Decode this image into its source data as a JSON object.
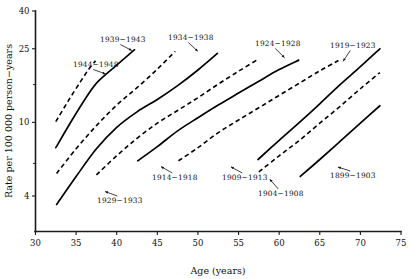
{
  "chart_data": {
    "type": "line",
    "title": "",
    "xlabel": "Age (years)",
    "ylabel": "Rate per 100 000 person−years",
    "xlim": [
      30,
      75
    ],
    "ylim": [
      3,
      40
    ],
    "yscale": "log",
    "grid": false,
    "legend": "inline-labels",
    "xticks": [
      30,
      35,
      40,
      45,
      50,
      55,
      60,
      65,
      70,
      75
    ],
    "xticklabels": [
      "30",
      "35",
      "40",
      "45",
      "50",
      "55",
      "60",
      "65",
      "70",
      "75"
    ],
    "yticks": [
      4,
      10,
      25,
      40
    ],
    "yticklabels": [
      "4",
      "10",
      "25",
      "40"
    ],
    "yticks_minor": [
      6,
      16
    ],
    "series": [
      {
        "name": "1944–1948",
        "style": "dashed",
        "label_text": "1944−1948",
        "x": [
          32.5,
          34.0,
          35.5,
          36.6,
          37.4
        ],
        "values": [
          10.1,
          13.0,
          16.5,
          19.5,
          21.5
        ]
      },
      {
        "name": "1939–1943",
        "style": "solid",
        "label_text": "1939−1943",
        "x": [
          32.5,
          34.5,
          36.5,
          37.8,
          40.0,
          42.2
        ],
        "values": [
          7.3,
          10.3,
          14.2,
          16.8,
          20.4,
          24.7
        ]
      },
      {
        "name": "1934–1938",
        "style": "dashed",
        "label_text": "1934−1938",
        "x": [
          32.6,
          35.0,
          37.5,
          40.0,
          42.5,
          45.0,
          47.2
        ],
        "values": [
          5.3,
          7.2,
          9.6,
          12.4,
          15.4,
          19.4,
          24.2
        ]
      },
      {
        "name": "1929–1933",
        "style": "solid",
        "label_text": "1929−1933",
        "x": [
          32.6,
          35.0,
          37.5,
          40.0,
          42.5,
          45.0,
          47.5,
          50.0,
          52.4
        ],
        "values": [
          3.6,
          5.1,
          7.2,
          9.4,
          11.4,
          13.3,
          15.8,
          19.2,
          23.6
        ]
      },
      {
        "name": "1924–1928",
        "style": "dashed",
        "label_text": "1924−1928",
        "x": [
          37.5,
          40.0,
          42.5,
          45.0,
          47.5,
          50.0,
          52.5,
          55.0,
          57.3
        ],
        "values": [
          5.2,
          6.6,
          8.2,
          9.9,
          11.6,
          13.6,
          16.1,
          18.9,
          21.8
        ]
      },
      {
        "name": "1914–1918",
        "style": "solid",
        "label_text": "1914−1918",
        "x": [
          42.6,
          45.0,
          47.5,
          50.0,
          52.5,
          55.0,
          57.5,
          60.0,
          62.4
        ],
        "values": [
          6.2,
          7.4,
          9.0,
          10.6,
          12.4,
          14.4,
          16.7,
          19.3,
          21.7
        ]
      },
      {
        "name": "1909–1913",
        "style": "dashed",
        "label_text": "1909−1913",
        "x": [
          47.6,
          50.0,
          52.5,
          55.0,
          57.5,
          60.0,
          62.5,
          65.0,
          67.3
        ],
        "values": [
          6.2,
          7.3,
          8.8,
          10.3,
          12.0,
          14.0,
          16.3,
          19.0,
          21.6
        ]
      },
      {
        "name": "1919–1923",
        "style": "solid",
        "label_text": "1919−1923",
        "x": [
          57.4,
          60.0,
          62.5,
          65.0,
          67.5,
          70.0,
          72.4
        ],
        "values": [
          6.3,
          8.0,
          10.0,
          12.6,
          16.0,
          20.0,
          25.0
        ]
      },
      {
        "name": "1904–1908",
        "style": "dashed",
        "label_text": "1904−1908",
        "x": [
          57.5,
          60.0,
          62.5,
          65.0,
          67.5,
          70.0,
          72.4
        ],
        "values": [
          5.4,
          6.6,
          8.0,
          9.9,
          12.2,
          15.2,
          18.6
        ]
      },
      {
        "name": "1899–1903",
        "style": "solid",
        "label_text": "1899−1903",
        "x": [
          62.6,
          65.0,
          67.5,
          70.0,
          72.4
        ],
        "values": [
          5.1,
          6.3,
          7.9,
          9.9,
          12.3
        ]
      }
    ],
    "annotations": [
      {
        "text": "1944−1948",
        "x": 73,
        "y": 67,
        "anchor": "start",
        "leader_to_x": 128,
        "leader_to_y": 82
      },
      {
        "text": "1939−1943",
        "x": 100,
        "y": 42,
        "anchor": "start",
        "leader_to_x": 150,
        "leader_to_y": 60
      },
      {
        "text": "1934−1938",
        "x": 168,
        "y": 40,
        "anchor": "start",
        "leader_to_x": 205,
        "leader_to_y": 58
      },
      {
        "text": "1929−1933",
        "x": 97,
        "y": 203,
        "anchor": "start",
        "leader_to_x": 87,
        "leader_to_y": 185
      },
      {
        "text": "1924−1928",
        "x": 255,
        "y": 46,
        "anchor": "start",
        "leader_to_x": 291,
        "leader_to_y": 64
      },
      {
        "text": "1914−1918",
        "x": 152,
        "y": 180,
        "anchor": "start",
        "leader_to_x": 153,
        "leader_to_y": 162
      },
      {
        "text": "1909−1913",
        "x": 222,
        "y": 180,
        "anchor": "start",
        "leader_to_x": 222,
        "leader_to_y": 162
      },
      {
        "text": "1919−1923",
        "x": 330,
        "y": 48,
        "anchor": "start",
        "leader_to_x": 340,
        "leader_to_y": 66
      },
      {
        "text": "1904−1908",
        "x": 258,
        "y": 196,
        "anchor": "start",
        "leader_to_x": 267,
        "leader_to_y": 176
      },
      {
        "text": "1899−1903",
        "x": 330,
        "y": 178,
        "anchor": "start",
        "leader_to_x": 322,
        "leader_to_y": 162
      }
    ]
  },
  "axes": {
    "x_title": "Age (years)",
    "y_title": "Rate per 100 000 person−years",
    "x_tick_labels": [
      "30",
      "35",
      "40",
      "45",
      "50",
      "55",
      "60",
      "65",
      "70",
      "75"
    ],
    "y_tick_labels": [
      "40",
      "25",
      "10",
      "4"
    ]
  },
  "colors": {
    "ink": "#111111",
    "background": "#ffffff",
    "curve": "#000000"
  }
}
